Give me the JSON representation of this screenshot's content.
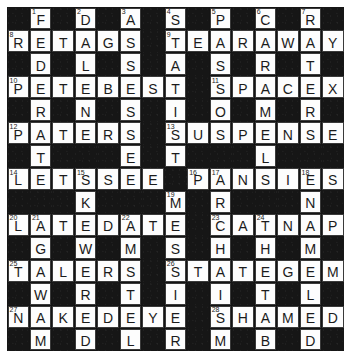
{
  "puzzle": {
    "type": "crossword-grid",
    "rows": 15,
    "cols": 15,
    "colors": {
      "block": "#161616",
      "open": "#fdfdfd",
      "letter": "#1b1b1b",
      "border": "#3a3a3a",
      "page_background": "#ffffff"
    },
    "grid": [
      [
        {
          "b": true
        },
        {
          "l": "F",
          "n": "1"
        },
        {
          "b": true
        },
        {
          "l": "D",
          "n": "2"
        },
        {
          "b": true
        },
        {
          "l": "A",
          "n": "3"
        },
        {
          "b": true
        },
        {
          "l": "S",
          "n": "4"
        },
        {
          "b": true
        },
        {
          "l": "P",
          "n": "5"
        },
        {
          "b": true
        },
        {
          "l": "C",
          "n": "6"
        },
        {
          "b": true
        },
        {
          "l": "R",
          "n": "7"
        },
        {
          "b": true
        }
      ],
      [
        {
          "l": "R",
          "n": "8"
        },
        {
          "l": "E"
        },
        {
          "l": "T"
        },
        {
          "l": "A"
        },
        {
          "l": "G"
        },
        {
          "l": "S"
        },
        {
          "b": true
        },
        {
          "l": "T",
          "n": "9"
        },
        {
          "l": "E"
        },
        {
          "l": "A"
        },
        {
          "l": "R"
        },
        {
          "l": "A"
        },
        {
          "l": "W"
        },
        {
          "l": "A"
        },
        {
          "l": "Y"
        }
      ],
      [
        {
          "b": true
        },
        {
          "l": "D"
        },
        {
          "b": true
        },
        {
          "l": "L"
        },
        {
          "b": true
        },
        {
          "l": "S"
        },
        {
          "b": true
        },
        {
          "l": "A"
        },
        {
          "b": true
        },
        {
          "l": "S"
        },
        {
          "b": true
        },
        {
          "l": "R"
        },
        {
          "b": true
        },
        {
          "l": "T"
        },
        {
          "b": true
        }
      ],
      [
        {
          "l": "P",
          "n": "10"
        },
        {
          "l": "E"
        },
        {
          "l": "T"
        },
        {
          "l": "E"
        },
        {
          "l": "B"
        },
        {
          "l": "E"
        },
        {
          "l": "S"
        },
        {
          "l": "T"
        },
        {
          "b": true
        },
        {
          "l": "S",
          "n": "11"
        },
        {
          "l": "P"
        },
        {
          "l": "A"
        },
        {
          "l": "C"
        },
        {
          "l": "E"
        },
        {
          "l": "X"
        }
      ],
      [
        {
          "b": true
        },
        {
          "l": "R"
        },
        {
          "b": true
        },
        {
          "l": "N"
        },
        {
          "b": true
        },
        {
          "l": "S"
        },
        {
          "b": true
        },
        {
          "l": "I"
        },
        {
          "b": true
        },
        {
          "l": "O"
        },
        {
          "b": true
        },
        {
          "l": "M"
        },
        {
          "b": true
        },
        {
          "l": "R"
        },
        {
          "b": true
        }
      ],
      [
        {
          "l": "P",
          "n": "12"
        },
        {
          "l": "A"
        },
        {
          "l": "T"
        },
        {
          "l": "E"
        },
        {
          "l": "R"
        },
        {
          "l": "S"
        },
        {
          "b": true
        },
        {
          "l": "S",
          "n": "13"
        },
        {
          "l": "U"
        },
        {
          "l": "S"
        },
        {
          "l": "P"
        },
        {
          "l": "E"
        },
        {
          "l": "N"
        },
        {
          "l": "S"
        },
        {
          "l": "E"
        }
      ],
      [
        {
          "b": true
        },
        {
          "l": "T"
        },
        {
          "b": true
        },
        {
          "b": true
        },
        {
          "b": true
        },
        {
          "l": "E"
        },
        {
          "b": true
        },
        {
          "l": "T"
        },
        {
          "b": true
        },
        {
          "b": true
        },
        {
          "b": true
        },
        {
          "l": "L"
        },
        {
          "b": true
        },
        {
          "b": true
        },
        {
          "b": true
        }
      ],
      [
        {
          "l": "L",
          "n": "14"
        },
        {
          "l": "E"
        },
        {
          "l": "T"
        },
        {
          "l": "S",
          "n": "15"
        },
        {
          "l": "S"
        },
        {
          "l": "E"
        },
        {
          "l": "E"
        },
        {
          "b": true
        },
        {
          "l": "P",
          "n": "16"
        },
        {
          "l": "A",
          "n": "17"
        },
        {
          "l": "N"
        },
        {
          "l": "S"
        },
        {
          "l": "I"
        },
        {
          "l": "E",
          "n": "18"
        },
        {
          "l": "S"
        }
      ],
      [
        {
          "b": true
        },
        {
          "b": true
        },
        {
          "b": true
        },
        {
          "l": "K"
        },
        {
          "b": true
        },
        {
          "b": true
        },
        {
          "b": true
        },
        {
          "l": "M",
          "n": "19"
        },
        {
          "b": true
        },
        {
          "l": "R"
        },
        {
          "b": true
        },
        {
          "b": true
        },
        {
          "b": true
        },
        {
          "l": "N"
        },
        {
          "b": true
        }
      ],
      [
        {
          "l": "L",
          "n": "20"
        },
        {
          "l": "A",
          "n": "21"
        },
        {
          "l": "T"
        },
        {
          "l": "E"
        },
        {
          "l": "D"
        },
        {
          "l": "A",
          "n": "22"
        },
        {
          "l": "T"
        },
        {
          "l": "E"
        },
        {
          "b": true
        },
        {
          "l": "C",
          "n": "23"
        },
        {
          "l": "A"
        },
        {
          "l": "T",
          "n": "24"
        },
        {
          "l": "N"
        },
        {
          "l": "A"
        },
        {
          "l": "P"
        }
      ],
      [
        {
          "b": true
        },
        {
          "l": "G"
        },
        {
          "b": true
        },
        {
          "l": "W"
        },
        {
          "b": true
        },
        {
          "l": "M"
        },
        {
          "b": true
        },
        {
          "l": "S"
        },
        {
          "b": true
        },
        {
          "l": "H"
        },
        {
          "b": true
        },
        {
          "l": "H"
        },
        {
          "b": true
        },
        {
          "l": "M"
        },
        {
          "b": true
        }
      ],
      [
        {
          "l": "T",
          "n": "25"
        },
        {
          "l": "A"
        },
        {
          "l": "L"
        },
        {
          "l": "E"
        },
        {
          "l": "R"
        },
        {
          "l": "S"
        },
        {
          "b": true
        },
        {
          "l": "S",
          "n": "26"
        },
        {
          "l": "T"
        },
        {
          "l": "A"
        },
        {
          "l": "T"
        },
        {
          "l": "E"
        },
        {
          "l": "G"
        },
        {
          "l": "E"
        },
        {
          "l": "M"
        }
      ],
      [
        {
          "b": true
        },
        {
          "l": "W"
        },
        {
          "b": true
        },
        {
          "l": "R"
        },
        {
          "b": true
        },
        {
          "l": "T"
        },
        {
          "b": true
        },
        {
          "l": "I"
        },
        {
          "b": true
        },
        {
          "l": "I"
        },
        {
          "b": true
        },
        {
          "l": "T"
        },
        {
          "b": true
        },
        {
          "l": "L"
        },
        {
          "b": true
        }
      ],
      [
        {
          "l": "N",
          "n": "27"
        },
        {
          "l": "A"
        },
        {
          "l": "K"
        },
        {
          "l": "E"
        },
        {
          "l": "D"
        },
        {
          "l": "E"
        },
        {
          "l": "Y"
        },
        {
          "l": "E"
        },
        {
          "b": true
        },
        {
          "l": "S",
          "n": "28"
        },
        {
          "l": "H"
        },
        {
          "l": "A"
        },
        {
          "l": "M"
        },
        {
          "l": "E"
        },
        {
          "l": "D"
        }
      ],
      [
        {
          "b": true
        },
        {
          "l": "M"
        },
        {
          "b": true
        },
        {
          "l": "D"
        },
        {
          "b": true
        },
        {
          "l": "L"
        },
        {
          "b": true
        },
        {
          "l": "R"
        },
        {
          "b": true
        },
        {
          "l": "M"
        },
        {
          "b": true
        },
        {
          "l": "B"
        },
        {
          "b": true
        },
        {
          "l": "D"
        },
        {
          "b": true
        }
      ]
    ]
  }
}
